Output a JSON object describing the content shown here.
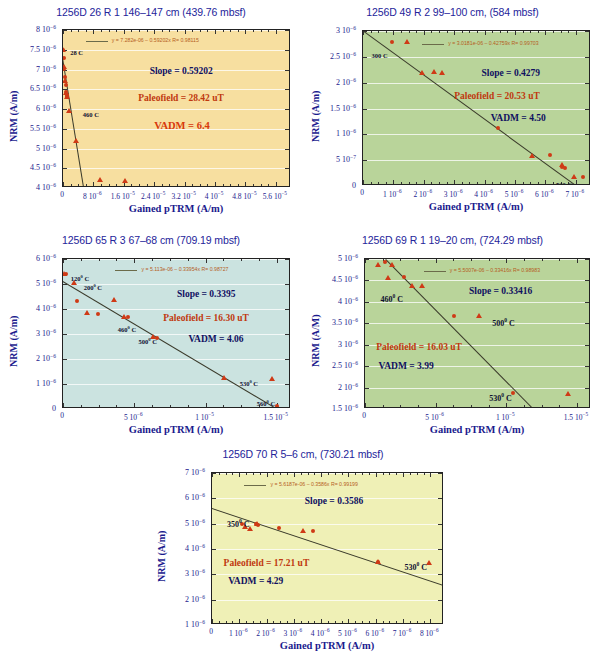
{
  "figure": {
    "axis_xlabel": "Gained pTRM (A/m)",
    "axis_ylabel_default": "NRM (A/m)"
  },
  "chart_data": [
    {
      "id": "chart-1",
      "type": "scatter",
      "title": "1256D 26 R 1 146–147 cm (439.76 mbsf)",
      "xlabel": "Gained pTRM (A/m)",
      "ylabel": "NRM (A/m)",
      "bg_color": "#f7dfa0",
      "point_color": "#cf3a16",
      "xlim": [
        0,
        6e-05
      ],
      "ylim": [
        4e-06,
        8e-06
      ],
      "xticks": [
        "0",
        "8 10-6",
        "1.6 10-5",
        "2.4 10-5",
        "3.2 10-5",
        "4 10-5",
        "4.8 10-5",
        "5.6 10-5"
      ],
      "xtick_values": [
        0,
        8e-06,
        1.6e-05,
        2.4e-05,
        3.2e-05,
        4e-05,
        4.8e-05,
        5.6e-05
      ],
      "yticks": [
        "4 10-6",
        "4.5 10-6",
        "5 10-6",
        "5.5 10-6",
        "6 10-6",
        "6.5 10-6",
        "7 10-6",
        "7.5 10-6",
        "8 10-6"
      ],
      "ytick_values": [
        4e-06,
        4.5e-06,
        5e-06,
        5.5e-06,
        6e-06,
        6.5e-06,
        7e-06,
        7.5e-06,
        8e-06
      ],
      "equation": "y = 7.282e-06 – 0.59202x   R= 0.98115",
      "slope_label": "Slope = 0.59202",
      "paleofield_label": "Paleofield = 28.42 uT",
      "vadm_label": "VADM = 6.4",
      "vadm_red": true,
      "temp_labels": [
        {
          "text": "28 C",
          "x": 1.9e-06,
          "y": 7.52e-06
        },
        {
          "text": "460 C",
          "x": 5.2e-06,
          "y": 5.95e-06
        }
      ],
      "series": [
        {
          "name": "circles",
          "marker": "circle",
          "x": [
            5e-08,
            1.5e-07,
            3e-07,
            5.5e-07,
            7e-07,
            8.5e-07,
            9.5e-07,
            1.05e-06,
            1.15e-06
          ],
          "y": [
            7.5e-06,
            7.28e-06,
            7.02e-06,
            6.8e-06,
            6.62e-06,
            6.42e-06,
            6.36e-06,
            6.32e-06,
            6.3e-06
          ]
        },
        {
          "name": "triangles",
          "marker": "triangle",
          "x": [
            5e-08,
            2.5e-07,
            6e-07,
            9e-07,
            1.1e-06,
            1.7e-06,
            3.3e-06,
            9.7e-06,
            1.62e-05
          ],
          "y": [
            7.5e-06,
            7.06e-06,
            6.7e-06,
            6.4e-06,
            6.3e-06,
            5.95e-06,
            5.2e-06,
            4.2e-06,
            4.18e-06
          ]
        }
      ],
      "fit": {
        "intercept": 7.282e-06,
        "slope": -0.59202
      }
    },
    {
      "id": "chart-2",
      "type": "scatter",
      "title": "1256D 49 R 2  99–100 cm, (584 mbsf)",
      "xlabel": "Gained pTRM (A/m)",
      "ylabel": "NRM (A/m)",
      "bg_color": "#b9d49a",
      "point_color": "#cf3a16",
      "xlim": [
        0,
        7.5e-06
      ],
      "ylim": [
        0,
        3e-06
      ],
      "xticks": [
        "0",
        "1 10-6",
        "2 10-6",
        "3 10-6",
        "4 10-6",
        "5 10-6",
        "6 10-6",
        "7 10-6"
      ],
      "xtick_values": [
        0,
        1e-06,
        2e-06,
        3e-06,
        4e-06,
        5e-06,
        6e-06,
        7e-06
      ],
      "yticks": [
        "0",
        "5 10-7",
        "1 10-6",
        "1.5 10-6",
        "2 10-6",
        "2.5 10-6",
        "3 10-6"
      ],
      "ytick_values": [
        0,
        5e-07,
        1e-06,
        1.5e-06,
        2e-06,
        2.5e-06,
        3e-06
      ],
      "equation": "y = 3.0181e-06 – 0.42759x   R= 0.99703",
      "slope_label": "Slope = 0.4279",
      "paleofield_label": "Paleofield = 20.53 uT",
      "vadm_label": "VADM = 4.50",
      "vadm_red": false,
      "temp_labels": [
        {
          "text": "300 C",
          "x": 2.8e-07,
          "y": 2.6e-06
        },
        {
          "text": "530 C",
          "x": 6.35e-06,
          "y": 1e-07
        }
      ],
      "series": [
        {
          "name": "circles",
          "marker": "circle",
          "x": [
            9.5e-07,
            4.45e-06,
            6.15e-06,
            6.55e-06,
            6.65e-06,
            7.25e-06
          ],
          "y": [
            2.78e-06,
            1.13e-06,
            6e-07,
            3.7e-07,
            3.5e-07,
            1.7e-07
          ]
        },
        {
          "name": "triangles",
          "marker": "triangle",
          "x": [
            1.45e-06,
            1.95e-06,
            2.35e-06,
            2.6e-06,
            5.55e-06,
            6.55e-06,
            6.95e-06
          ],
          "y": [
            2.78e-06,
            2.18e-06,
            2.2e-06,
            2.18e-06,
            5.8e-07,
            4e-07,
            1.7e-07
          ]
        }
      ],
      "fit": {
        "intercept": 3.0181e-06,
        "slope": -0.42759
      }
    },
    {
      "id": "chart-3",
      "type": "scatter",
      "title": "1256D 65 R 3 67–68 cm (709.19 mbsf)",
      "xlabel": "Gained pTRM (A/m)",
      "ylabel": "NRM (A/m)",
      "bg_color": "#cbe3e0",
      "point_color": "#cf3a16",
      "xlim": [
        0,
        1.6e-05
      ],
      "ylim": [
        0,
        6e-06
      ],
      "xticks": [
        "0",
        "5 10-6",
        "1 10-5",
        "1.5 10-5"
      ],
      "xtick_values": [
        0,
        5e-06,
        1e-05,
        1.5e-05
      ],
      "yticks": [
        "0",
        "1 10-6",
        "2 10-6",
        "3 10-6",
        "4 10-6",
        "5 10-6",
        "6 10-6"
      ],
      "ytick_values": [
        0,
        1e-06,
        2e-06,
        3e-06,
        4e-06,
        5e-06,
        6e-06
      ],
      "equation": "y = 5.113e-06 – 0.33954x   R= 0.98727",
      "slope_label": "Slope = 0.3395",
      "paleofield_label": "Paleofield = 16.30 uT",
      "vadm_label": "VADM = 4.06",
      "vadm_red": false,
      "temp_labels": [
        {
          "text": "120° C",
          "x": 5.5e-07,
          "y": 5.4e-06
        },
        {
          "text": "200° C",
          "x": 1.45e-06,
          "y": 5.05e-06
        },
        {
          "text": "460° C",
          "x": 3.85e-06,
          "y": 3.35e-06
        },
        {
          "text": "500° C",
          "x": 5.3e-06,
          "y": 2.88e-06
        },
        {
          "text": "530° C",
          "x": 1.24e-05,
          "y": 1.22e-06
        },
        {
          "text": "560° C",
          "x": 1.36e-05,
          "y": 4e-07
        }
      ],
      "series": [
        {
          "name": "circles",
          "marker": "circle",
          "x": [
            1.8e-07,
            9.5e-07,
            2.45e-06,
            4.55e-06,
            6.6e-06,
            1.5e-05
          ],
          "y": [
            5.42e-06,
            4.32e-06,
            3.82e-06,
            3.7e-06,
            2.85e-06,
            1.2e-07
          ]
        },
        {
          "name": "triangles",
          "marker": "triangle",
          "x": [
            8e-08,
            8e-07,
            1.7e-06,
            3.6e-06,
            4.3e-06,
            6.35e-06,
            1.13e-05,
            1.47e-05
          ],
          "y": [
            5.42e-06,
            5.05e-06,
            3.85e-06,
            4.35e-06,
            3.68e-06,
            2.88e-06,
            1.25e-06,
            1.22e-06
          ]
        }
      ],
      "fit": {
        "intercept": 5.113e-06,
        "slope": -0.33954
      }
    },
    {
      "id": "chart-4",
      "type": "scatter",
      "title": "1256D  69 R 1 19–20 cm, (724.29 mbsf)",
      "xlabel": "Gained pTRM (A/m)",
      "ylabel": "NRM (A/M)",
      "bg_color": "#b9d49a",
      "point_color": "#cf3a16",
      "xlim": [
        0,
        1.6e-05
      ],
      "ylim": [
        1.5e-06,
        5e-06
      ],
      "xticks": [
        "0",
        "5 10-6",
        "1 10-5",
        "1.5 10-5"
      ],
      "xtick_values": [
        0,
        5e-06,
        1e-05,
        1.5e-05
      ],
      "yticks": [
        "1.5 10-6",
        "2 10-6",
        "2.5 10-6",
        "3 10-6",
        "3.5 10-6",
        "4 10-6",
        "4.5 10-6",
        "5 10-6"
      ],
      "ytick_values": [
        1.5e-06,
        2e-06,
        2.5e-06,
        3e-06,
        3.5e-06,
        4e-06,
        4.5e-06,
        5e-06
      ],
      "equation": "y = 5.5007e-06 – 0.33416x   R= 0.98983",
      "slope_label": "Slope = 0.33416",
      "paleofield_label": "Paleofield = 16.03 uT",
      "vadm_label": "VADM = 3.99",
      "vadm_red": false,
      "temp_labels": [
        {
          "text": "460° C",
          "x": 1.1e-06,
          "y": 4.2e-06,
          "big": true
        },
        {
          "text": "500° C",
          "x": 9e-06,
          "y": 3.65e-06,
          "big": true
        },
        {
          "text": "530° C",
          "x": 8.8e-06,
          "y": 1.9e-06,
          "big": true
        }
      ],
      "series": [
        {
          "name": "circles",
          "marker": "circle",
          "x": [
            1.45e-06,
            2.75e-06,
            6.3e-06,
            1.05e-05
          ],
          "y": [
            4.93e-06,
            4.57e-06,
            3.67e-06,
            1.87e-06
          ]
        },
        {
          "name": "triangles",
          "marker": "triangle",
          "x": [
            9.5e-07,
            1.9e-06,
            1.6e-06,
            3.35e-06,
            4e-06,
            8.1e-06,
            1.44e-05
          ],
          "y": [
            4.87e-06,
            4.87e-06,
            4.55e-06,
            4.37e-06,
            4.38e-06,
            3.67e-06,
            1.85e-06
          ]
        }
      ],
      "fit": {
        "intercept": 5.5007e-06,
        "slope": -0.33416
      }
    },
    {
      "id": "chart-5",
      "type": "scatter",
      "title": "1256D 70 R 5–6 cm, (730.21 mbsf)",
      "xlabel": "Gained pTRM (A/m)",
      "ylabel": "NRM (A/m)",
      "bg_color": "#eff0b6",
      "point_color": "#cf3a16",
      "xlim": [
        0,
        8.5e-06
      ],
      "ylim": [
        1e-06,
        7e-06
      ],
      "xticks": [
        "0",
        "1 10-6",
        "2 10-6",
        "3 10-6",
        "4 10-6",
        "5 10-6",
        "6 10-6",
        "7 10-6",
        "8 10-6"
      ],
      "xtick_values": [
        0,
        1e-06,
        2e-06,
        3e-06,
        4e-06,
        5e-06,
        6e-06,
        7e-06,
        8e-06
      ],
      "yticks": [
        "1 10-6",
        "2 10-6",
        "3 10-6",
        "4 10-6",
        "5 10-6",
        "6 10-6",
        "7 10-6"
      ],
      "ytick_values": [
        1e-06,
        2e-06,
        3e-06,
        4e-06,
        5e-06,
        6e-06,
        7e-06
      ],
      "equation": "y = 5.6187e-06 – 0.3586x   R= 0.99199",
      "slope_label": "Slope = 0.3586",
      "paleofield_label": "Paleofield = 17.21 uT",
      "vadm_label": "VADM = 4.29",
      "vadm_red": false,
      "temp_labels": [
        {
          "text": "350° C",
          "x": 5.5e-07,
          "y": 5.22e-06,
          "big": true
        },
        {
          "text": "530° C",
          "x": 7.05e-06,
          "y": 3.52e-06,
          "big": true
        }
      ],
      "series": [
        {
          "name": "circles",
          "marker": "circle",
          "x": [
            1.1e-06,
            1.62e-06,
            1.7e-06,
            2.45e-06,
            3.7e-06,
            6.1e-06
          ],
          "y": [
            4.98e-06,
            4.98e-06,
            4.95e-06,
            4.83e-06,
            4.72e-06,
            3.47e-06
          ]
        },
        {
          "name": "triangles",
          "marker": "triangle",
          "x": [
            1.2e-06,
            1.4e-06,
            1.65e-06,
            3.35e-06,
            6.08e-06,
            7.95e-06
          ],
          "y": [
            4.88e-06,
            4.8e-06,
            4.97e-06,
            4.7e-06,
            3.48e-06,
            3.45e-06
          ]
        }
      ],
      "fit": {
        "intercept": 5.6187e-06,
        "slope": -0.3586
      }
    }
  ],
  "layout": [
    {
      "id": "chart-1",
      "left": 0,
      "top": 2,
      "width": 302,
      "height": 215,
      "plot": {
        "left": 62,
        "top": 27,
        "width": 228,
        "height": 158
      },
      "title_top": 4,
      "slope_pos": [
        0.38,
        0.23
      ],
      "paleo_pos": [
        0.33,
        0.4
      ],
      "vadm_pos": [
        0.4,
        0.57
      ],
      "eq_pos": [
        0.1,
        0.045
      ]
    },
    {
      "id": "chart-2",
      "left": 302,
      "top": 2,
      "width": 301,
      "height": 215,
      "plot": {
        "left": 60,
        "top": 28,
        "width": 228,
        "height": 155
      },
      "title_top": 4,
      "slope_pos": [
        0.52,
        0.24
      ],
      "paleo_pos": [
        0.4,
        0.39
      ],
      "vadm_pos": [
        0.56,
        0.53
      ],
      "eq_pos": [
        0.26,
        0.055
      ]
    },
    {
      "id": "chart-3",
      "left": 0,
      "top": 232,
      "width": 302,
      "height": 206,
      "plot": {
        "left": 62,
        "top": 26,
        "width": 228,
        "height": 150
      },
      "title_top": 2,
      "slope_pos": [
        0.5,
        0.2
      ],
      "paleo_pos": [
        0.44,
        0.36
      ],
      "vadm_pos": [
        0.55,
        0.5
      ],
      "eq_pos": [
        0.23,
        0.045
      ]
    },
    {
      "id": "chart-4",
      "left": 302,
      "top": 232,
      "width": 301,
      "height": 206,
      "plot": {
        "left": 62,
        "top": 26,
        "width": 226,
        "height": 150
      },
      "title_top": 2,
      "slope_pos": [
        0.46,
        0.18
      ],
      "paleo_pos": [
        0.05,
        0.55
      ],
      "vadm_pos": [
        0.06,
        0.68
      ],
      "eq_pos": [
        0.26,
        0.055
      ]
    },
    {
      "id": "chart-5",
      "left": 148,
      "top": 446,
      "width": 310,
      "height": 212,
      "plot": {
        "left": 63,
        "top": 26,
        "width": 232,
        "height": 152
      },
      "title_top": 2,
      "slope_pos": [
        0.4,
        0.15
      ],
      "paleo_pos": [
        0.05,
        0.56
      ],
      "vadm_pos": [
        0.07,
        0.68
      ],
      "eq_pos": [
        0.14,
        0.05
      ]
    }
  ]
}
